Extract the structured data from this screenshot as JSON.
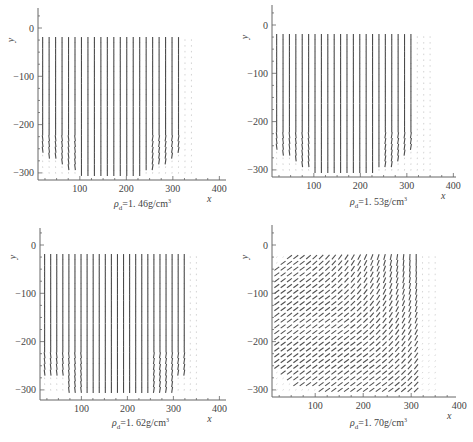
{
  "chart_data": [
    {
      "type": "quiver",
      "title": "",
      "caption": {
        "symbol": "ρ",
        "subscript": "d",
        "value": "=1. 46g/cm",
        "sup": "3"
      },
      "caption_text": "ρd=1.46g/cm3",
      "xlabel": "x",
      "ylabel": "y",
      "xlim": [
        10,
        410
      ],
      "ylim": [
        -315,
        50
      ],
      "xticks": [
        100,
        200,
        300,
        400
      ],
      "yticks": [
        0,
        -100,
        -200,
        -300
      ],
      "grid": false,
      "field": {
        "pattern": "vertical-down",
        "x_range": [
          20,
          340
        ],
        "y_range": [
          -300,
          -25
        ],
        "columns": 24,
        "rows": 24,
        "strong_x_max": 320,
        "bottom_curve": true
      }
    },
    {
      "type": "quiver",
      "title": "",
      "caption": {
        "symbol": "ρ",
        "subscript": "d",
        "value": "=1. 53g/cm",
        "sup": "3"
      },
      "caption_text": "ρd=1.53g/cm3",
      "xlabel": "x",
      "ylabel": "y",
      "xlim": [
        10,
        410
      ],
      "ylim": [
        -315,
        50
      ],
      "xticks": [
        100,
        200,
        300,
        400
      ],
      "yticks": [
        0,
        -100,
        -200,
        -300
      ],
      "grid": false,
      "field": {
        "pattern": "vertical-down",
        "x_range": [
          20,
          350
        ],
        "y_range": [
          -300,
          -25
        ],
        "columns": 25,
        "rows": 24,
        "strong_x_max": 310,
        "bottom_curve": true
      }
    },
    {
      "type": "quiver",
      "title": "",
      "caption": {
        "symbol": "ρ",
        "subscript": "d",
        "value": "=1. 62g/cm",
        "sup": "3"
      },
      "caption_text": "ρd=1.62g/cm3",
      "xlabel": "x",
      "ylabel": "y",
      "xlim": [
        10,
        410
      ],
      "ylim": [
        -315,
        50
      ],
      "xticks": [
        100,
        200,
        300,
        400
      ],
      "yticks": [
        0,
        -100,
        -200,
        -300
      ],
      "grid": false,
      "field": {
        "pattern": "vertical-down",
        "x_range": [
          20,
          350
        ],
        "y_range": [
          -300,
          -25
        ],
        "columns": 26,
        "rows": 24,
        "strong_x_max": 330,
        "bottom_curve": false
      }
    },
    {
      "type": "quiver",
      "title": "",
      "caption": {
        "symbol": "ρ",
        "subscript": "d",
        "value": "=1. 70g/cm",
        "sup": "3"
      },
      "caption_text": "ρd=1.70g/cm3",
      "xlabel": "x",
      "ylabel": "y",
      "xlim": [
        10,
        410
      ],
      "ylim": [
        -315,
        50
      ],
      "xticks": [
        100,
        200,
        300,
        400
      ],
      "yticks": [
        0,
        -100,
        -200,
        -300
      ],
      "grid": false,
      "field": {
        "pattern": "rotational",
        "x_range": [
          20,
          350
        ],
        "y_range": [
          -300,
          -25
        ],
        "columns": 26,
        "rows": 24,
        "strong_x_max": 320,
        "bottom_curve": true
      }
    }
  ],
  "panels": [
    {
      "caption": "ρd=1.46g/cm3"
    },
    {
      "caption": "ρd=1.53g/cm3"
    },
    {
      "caption": "ρd=1.62g/cm3"
    },
    {
      "caption": "ρd=1.70g/cm3"
    }
  ]
}
